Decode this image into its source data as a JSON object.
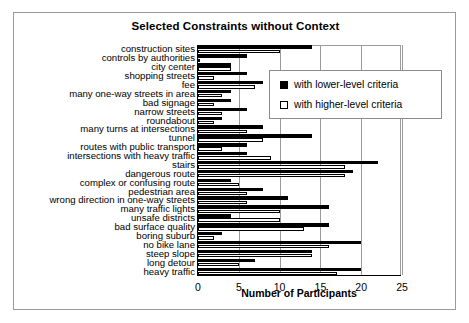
{
  "figure": {
    "title": "Selected Constraints without Context"
  },
  "legend": {
    "position": "top-right-inside",
    "entries": [
      {
        "label": "with lower-level criteria",
        "swatch": "filled-square-icon",
        "color": "#000000"
      },
      {
        "label": "with higher-level criteria",
        "swatch": "hollow-square-icon",
        "color": "#ffffff"
      }
    ]
  },
  "chart_data": {
    "type": "bar",
    "orientation": "horizontal",
    "title": "Selected Constraints without Context",
    "xlabel": "Number of Participants",
    "ylabel": "",
    "xlim": [
      0,
      25
    ],
    "xticks": [
      0,
      5,
      10,
      15,
      20,
      25
    ],
    "xticklabels": [
      "0",
      "5",
      "10",
      "15",
      "20",
      "25"
    ],
    "grid": "vertical",
    "categories": [
      "construction sites",
      "controls by authorities",
      "city center",
      "shopping streets",
      "fee",
      "many one-way streets in area",
      "bad signage",
      "narrow streets",
      "roundabout",
      "many turns at intersections",
      "tunnel",
      "routes with public transport",
      "intersections with heavy traffic",
      "stairs",
      "dangerous route",
      "complex or confusing route",
      "pedestrian area",
      "wrong direction in one-way streets",
      "many traffic lights",
      "unsafe districts",
      "bad surface quality",
      "boring suburb",
      "no bike lane",
      "steep slope",
      "long detour",
      "heavy traffic"
    ],
    "series": [
      {
        "name": "with lower-level criteria",
        "color": "#000000",
        "values": [
          14,
          6,
          4,
          6,
          8,
          4,
          4,
          6,
          3,
          8,
          14,
          6,
          6,
          22,
          19,
          4,
          8,
          11,
          16,
          4,
          16,
          3,
          20,
          14,
          7,
          20
        ]
      },
      {
        "name": "with higher-level criteria",
        "color": "#ffffff",
        "values": [
          10,
          0,
          4,
          2,
          7,
          3,
          2,
          3,
          2,
          6,
          8,
          3,
          9,
          18,
          18,
          5,
          6,
          6,
          10,
          10,
          13,
          2,
          16,
          14,
          5,
          17
        ]
      }
    ]
  }
}
